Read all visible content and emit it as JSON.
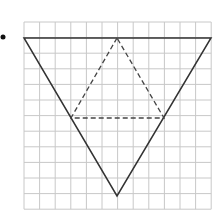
{
  "figure": {
    "bullet": "•",
    "grid": {
      "x0": 24,
      "y0": 22,
      "cols": 12,
      "rows": 12,
      "cell": 15.6,
      "color": "#c8c8c8"
    },
    "outer_triangle": {
      "points": [
        [
          24,
          38
        ],
        [
          211,
          38
        ],
        [
          117,
          196
        ]
      ],
      "style": "solid",
      "color": "#333333"
    },
    "inner_triangle": {
      "points": [
        [
          117,
          38
        ],
        [
          71,
          118
        ],
        [
          164,
          118
        ]
      ],
      "style": "dashed",
      "color": "#444444"
    }
  }
}
